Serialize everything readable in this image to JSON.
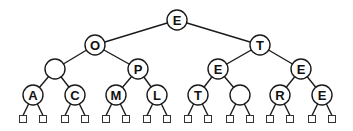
{
  "diagram": {
    "type": "binary-tree",
    "node_radius": 10,
    "leaf_size": 7,
    "nodes": [
      {
        "id": "n0",
        "label": "E",
        "x": 177,
        "y": 20
      },
      {
        "id": "n1",
        "label": "O",
        "x": 95,
        "y": 45
      },
      {
        "id": "n2",
        "label": "T",
        "x": 260,
        "y": 45
      },
      {
        "id": "n3",
        "label": "",
        "x": 55,
        "y": 69
      },
      {
        "id": "n4",
        "label": "P",
        "x": 138,
        "y": 69
      },
      {
        "id": "n5",
        "label": "E",
        "x": 218,
        "y": 69
      },
      {
        "id": "n6",
        "label": "E",
        "x": 301,
        "y": 69
      },
      {
        "id": "n7",
        "label": "A",
        "x": 33,
        "y": 95
      },
      {
        "id": "n8",
        "label": "C",
        "x": 75,
        "y": 95
      },
      {
        "id": "n9",
        "label": "M",
        "x": 116,
        "y": 95
      },
      {
        "id": "n10",
        "label": "L",
        "x": 157,
        "y": 95
      },
      {
        "id": "n11",
        "label": "T",
        "x": 198,
        "y": 95
      },
      {
        "id": "n12",
        "label": "",
        "x": 240,
        "y": 95
      },
      {
        "id": "n13",
        "label": "R",
        "x": 280,
        "y": 95
      },
      {
        "id": "n14",
        "label": "E",
        "x": 322,
        "y": 95
      }
    ],
    "edges": [
      [
        "n0",
        "n1"
      ],
      [
        "n0",
        "n2"
      ],
      [
        "n1",
        "n3"
      ],
      [
        "n1",
        "n4"
      ],
      [
        "n2",
        "n5"
      ],
      [
        "n2",
        "n6"
      ],
      [
        "n3",
        "n7"
      ],
      [
        "n3",
        "n8"
      ],
      [
        "n4",
        "n9"
      ],
      [
        "n4",
        "n10"
      ],
      [
        "n5",
        "n11"
      ],
      [
        "n5",
        "n12"
      ],
      [
        "n6",
        "n13"
      ],
      [
        "n6",
        "n14"
      ]
    ],
    "leaf_offset_x": 10,
    "leaf_y": 119
  }
}
